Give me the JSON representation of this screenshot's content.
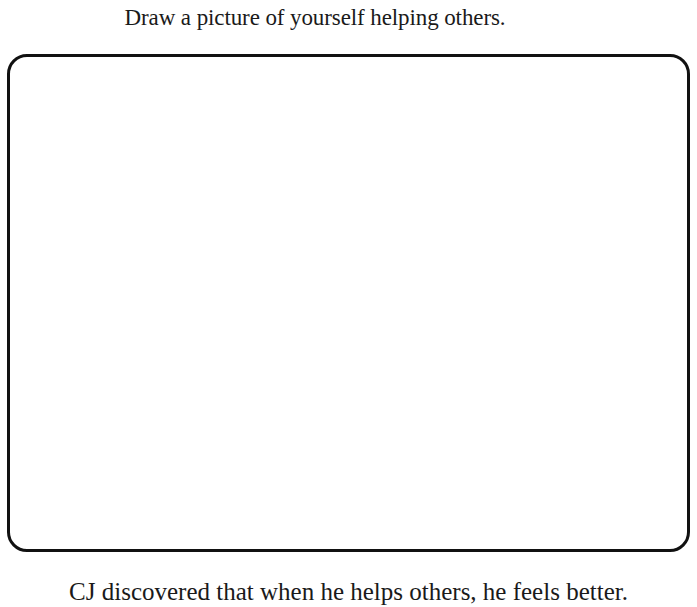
{
  "worksheet": {
    "instruction": "Draw a picture of yourself helping others.",
    "drawing_area": {
      "content": ""
    },
    "caption": "CJ discovered that when he helps others, he feels better."
  }
}
